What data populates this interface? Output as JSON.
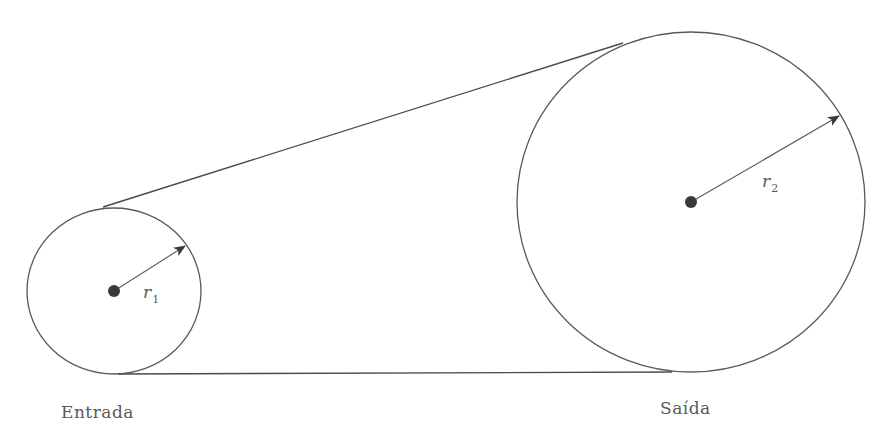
{
  "diagram": {
    "type": "belt-pulley-system",
    "input_pulley": {
      "caption": "Entrada",
      "radius_label": "r",
      "radius_subscript": "1",
      "center": [
        114,
        291
      ],
      "rx": 87,
      "ry": 83,
      "arrow_tip": [
        185,
        246
      ]
    },
    "output_pulley": {
      "caption": "Saída",
      "radius_label": "r",
      "radius_subscript": "2",
      "center": [
        691,
        202
      ],
      "rx": 174,
      "ry": 170,
      "arrow_tip": [
        839,
        116
      ]
    },
    "belt": {
      "upper_segment": [
        [
          103,
          207
        ],
        [
          623,
          43
        ]
      ],
      "lower_segment": [
        [
          118,
          374
        ],
        [
          672,
          372
        ]
      ]
    },
    "colors": {
      "stroke": "#5a5a5a",
      "axle": "#3a3a3a",
      "text": "#5a5a5a",
      "background": "#ffffff"
    }
  }
}
